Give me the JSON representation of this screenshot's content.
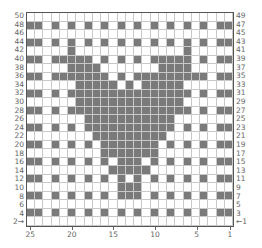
{
  "chart_title": "",
  "grid": {
    "columns": 25,
    "rows": 25,
    "dark_color": "#7a7a7a",
    "light_color": "#ffffff",
    "line_color": "#c8c8c8"
  },
  "left_row_labels": [
    "50",
    "48",
    "46",
    "44",
    "42",
    "40",
    "38",
    "36",
    "34",
    "32",
    "30",
    "28",
    "26",
    "24",
    "22",
    "20",
    "18",
    "16",
    "14",
    "12",
    "10",
    "8",
    "6",
    "4",
    "2→"
  ],
  "right_row_labels": [
    "49",
    "47",
    "45",
    "43",
    "41",
    "39",
    "37",
    "35",
    "33",
    "31",
    "29",
    "27",
    "25",
    "23",
    "21",
    "19",
    "17",
    "15",
    "13",
    "11",
    "9",
    "7",
    "5",
    "3",
    "←1"
  ],
  "column_labels": [
    {
      "label": "25",
      "col": 0
    },
    {
      "label": "20",
      "col": 5
    },
    {
      "label": "15",
      "col": 10
    },
    {
      "label": "10",
      "col": 15
    },
    {
      "label": "5",
      "col": 20
    },
    {
      "label": "1",
      "col": 24
    }
  ],
  "chart_data": {
    "type": "heatmap",
    "xlabel": "stitch",
    "ylabel": "row",
    "x_ticks": [
      "25",
      "20",
      "15",
      "10",
      "5",
      "1"
    ],
    "rows": [
      "0000000000000000000000000",
      "1101010101010101010101011",
      "0000000000000000000000000",
      "1101010101010101010101011",
      "0000010000000000000100000",
      "1101111101010101111101011",
      "0000011110000000111100000",
      "1101111111010111111111011",
      "0000001111101011111000000",
      "1101011111111111111101011",
      "0000001111111111111000000",
      "1101011111111111111101011",
      "0000000111111111110000000",
      "1101010111111111110101011",
      "0000000011111111100000000",
      "1101010101111111010101011",
      "0000000001111111000000000",
      "1101010101011101010101011",
      "0000000000111110000000000",
      "1101010101010101010101011",
      "0000000000011100000000000",
      "1101010101011101010101011",
      "0000000000000000000000000",
      "1101010101010101010101011",
      "0000000000000000000000000"
    ]
  }
}
